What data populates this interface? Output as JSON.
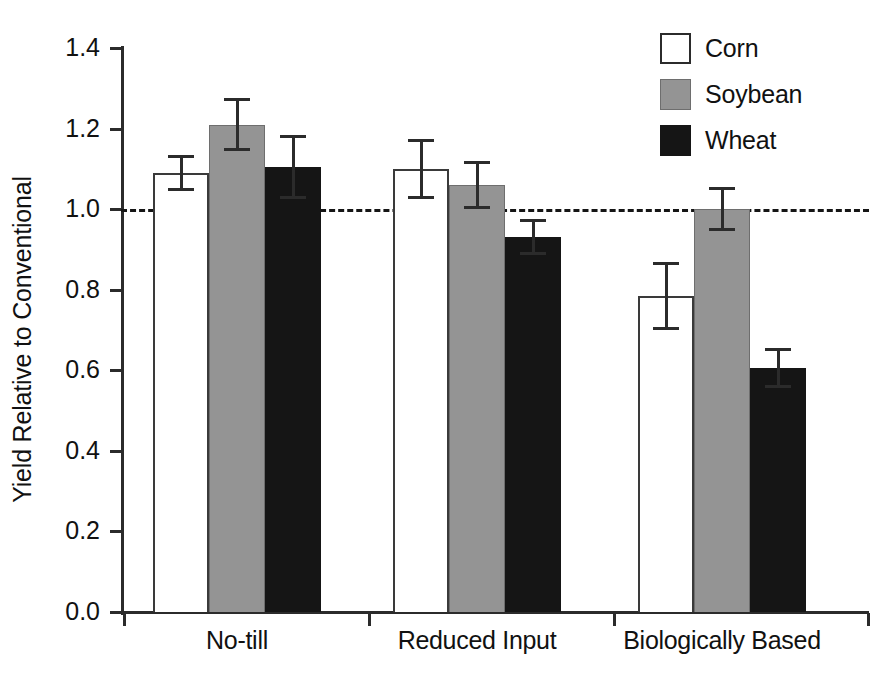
{
  "chart_data": {
    "type": "bar",
    "title": "",
    "xlabel": "",
    "ylabel": "Yield Relative to Conventional",
    "categories": [
      "No-till",
      "Reduced Input",
      "Biologically Based"
    ],
    "ylim": [
      0.0,
      1.4
    ],
    "yticks": [
      "0.0",
      "0.2",
      "0.4",
      "0.6",
      "0.8",
      "1.0",
      "1.2",
      "1.4"
    ],
    "ytick_values": [
      0.0,
      0.2,
      0.4,
      0.6,
      0.8,
      1.0,
      1.2,
      1.4
    ],
    "grid": false,
    "legend_position": "top-right",
    "reference_line": {
      "value": 1.0,
      "style": "dashed",
      "color": "#151515"
    },
    "series": [
      {
        "name": "Corn",
        "color": "#ffffff",
        "edge_color": "#3a3a3a",
        "values": [
          1.09,
          1.1,
          0.785
        ],
        "errors": [
          0.045,
          0.075,
          0.085
        ]
      },
      {
        "name": "Soybean",
        "color": "#949494",
        "edge_color": "#6e6e6e",
        "values": [
          1.21,
          1.06,
          1.0
        ],
        "errors": [
          0.065,
          0.06,
          0.055
        ]
      },
      {
        "name": "Wheat",
        "color": "#151515",
        "edge_color": "#151515",
        "values": [
          1.105,
          0.93,
          0.605
        ],
        "errors": [
          0.08,
          0.045,
          0.05
        ]
      }
    ]
  },
  "legend": {
    "items": [
      {
        "label": "Corn",
        "swatch": "corn"
      },
      {
        "label": "Soybean",
        "swatch": "soybean"
      },
      {
        "label": "Wheat",
        "swatch": "wheat"
      }
    ]
  },
  "axis": {
    "y_title": "Yield Relative to Conventional"
  }
}
